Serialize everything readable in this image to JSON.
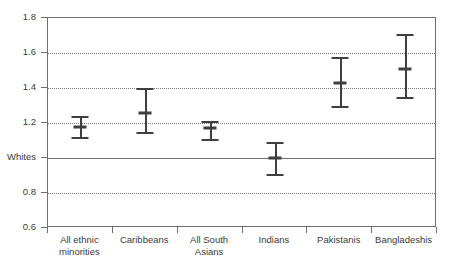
{
  "chart_data": {
    "type": "scatter",
    "title": "",
    "subtitle": "",
    "xlabel": "",
    "ylabel": "",
    "ylim": [
      0.6,
      1.8
    ],
    "grid": true,
    "legend": null,
    "reference_line": {
      "value": 1.0,
      "label": "Whites",
      "style": "solid"
    },
    "ytick_values": [
      0.6,
      0.8,
      1.0,
      1.2,
      1.4,
      1.6,
      1.8
    ],
    "ytick_labels": [
      "0.6",
      "0.8",
      "Whites",
      "1.2",
      "1.4",
      "1.6",
      "1.8"
    ],
    "categories": [
      "All ethnic minorities",
      "Caribbeans",
      "All South Asians",
      "Indians",
      "Pakistanis",
      "Bangladeshis"
    ],
    "category_lines": [
      [
        "All ethnic",
        "minorities"
      ],
      [
        "Caribbeans"
      ],
      [
        "All South",
        "Asians"
      ],
      [
        "Indians"
      ],
      [
        "Pakistanis"
      ],
      [
        "Bangladeshis"
      ]
    ],
    "values": [
      1.18,
      1.26,
      1.17,
      1.0,
      1.43,
      1.51
    ],
    "ci_lower": [
      1.12,
      1.15,
      1.11,
      0.91,
      1.3,
      1.35
    ],
    "ci_upper": [
      1.24,
      1.4,
      1.21,
      1.09,
      1.58,
      1.71
    ],
    "series": [
      {
        "name": "Estimate with 95% confidence interval",
        "points": [
          {
            "category": "All ethnic minorities",
            "value": 1.18,
            "low": 1.12,
            "high": 1.24
          },
          {
            "category": "Caribbeans",
            "value": 1.26,
            "low": 1.15,
            "high": 1.4
          },
          {
            "category": "All South Asians",
            "value": 1.17,
            "low": 1.11,
            "high": 1.21
          },
          {
            "category": "Indians",
            "value": 1.0,
            "low": 0.91,
            "high": 1.09
          },
          {
            "category": "Pakistanis",
            "value": 1.43,
            "low": 1.3,
            "high": 1.58
          },
          {
            "category": "Bangladeshis",
            "value": 1.51,
            "low": 1.35,
            "high": 1.71
          }
        ]
      }
    ],
    "colors": {
      "marker": "#3f3f3f",
      "axis": "#6e6e6e",
      "grid": "#7a7a7a",
      "text": "#3a3a3a",
      "background": "#ffffff"
    }
  }
}
